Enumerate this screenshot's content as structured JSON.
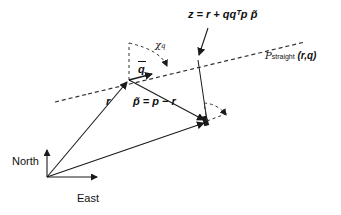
{
  "diagram": {
    "type": "vector-geometry",
    "colors": {
      "stroke": "#1a1a1a",
      "dashed": "#333333",
      "background": "#ffffff"
    },
    "labels": {
      "z_equation": "z = r + qqᵀp p̃",
      "line_label_main": "𝒫",
      "line_label_sub": "straight",
      "line_label_args": "(r,q)",
      "chi": "χ",
      "chi_sub": "q",
      "q_vec": "q",
      "r_label": "r",
      "p_tilde_eq": "p̃ = p − r",
      "north": "North",
      "east": "East"
    },
    "points": {
      "origin": [
        47,
        177
      ],
      "r": [
        129,
        80
      ],
      "p": [
        207,
        121
      ],
      "z": [
        198,
        58
      ],
      "line_start": [
        8,
        114
      ],
      "line_end": [
        305,
        42
      ]
    }
  }
}
